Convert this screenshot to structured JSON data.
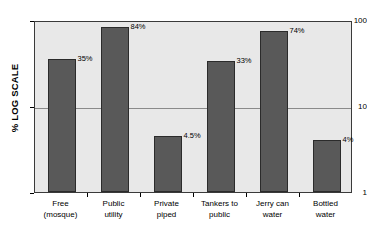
{
  "chart_data": {
    "type": "bar",
    "title": "",
    "xlabel": "",
    "ylabel": "% LOG SCALE",
    "scale": "log",
    "grid": true,
    "legend": null,
    "ylim": [
      1,
      100
    ],
    "y_ticks": [
      "100",
      "10",
      "1"
    ],
    "y_tick_values": [
      100,
      10,
      1
    ],
    "categories": [
      "Free (mosque)",
      "Public utility",
      "Private piped",
      "Tankers to public",
      "Jerry can water",
      "Bottled water"
    ],
    "category_lines": [
      {
        "line1": "Free",
        "line2": "(mosque)"
      },
      {
        "line1": "Public",
        "line2": "utility"
      },
      {
        "line1": "Private",
        "line2": "piped"
      },
      {
        "line1": "Tankers to",
        "line2": "public"
      },
      {
        "line1": "Jerry can",
        "line2": "water"
      },
      {
        "line1": "Bottled",
        "line2": "water"
      }
    ],
    "values": [
      35,
      84,
      4.5,
      33,
      74,
      4
    ],
    "value_labels": [
      "35%",
      "84%",
      "4.5%",
      "33%",
      "74%",
      "4%"
    ],
    "bar_color": "#595959",
    "bar_border_color": "#2b2b2b",
    "plot_background": "#e8e8e8",
    "gridline_color": "#8a8a8a",
    "axis_color": "#3a3a3a"
  }
}
